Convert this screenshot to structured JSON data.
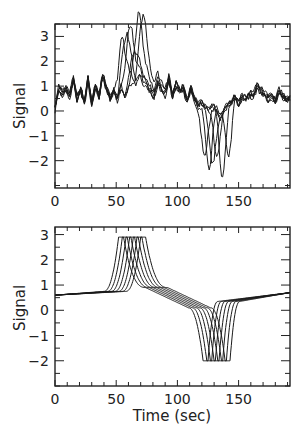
{
  "chart_data": [
    {
      "type": "line",
      "panel": "top",
      "title": "",
      "xlabel": "",
      "ylabel": "Signal",
      "xlim": [
        0,
        192
      ],
      "ylim": [
        -3.1,
        3.5
      ],
      "xticks": [
        0,
        50,
        100,
        150
      ],
      "yticks": [
        -2,
        -1,
        0,
        1,
        2,
        3
      ],
      "xminor_step": 10,
      "yminor_step": 0.5,
      "grid": false,
      "legend": null,
      "description": "Noisy measured signals, ~6 overlapping traces; positive peaks near t=55-72 s (max ~3.3), negative dips near t=122-142 s (min ~-2.7)",
      "baseline_noise": {
        "x": [
          0,
          3,
          6,
          9,
          12,
          15,
          18,
          21,
          24,
          27,
          30,
          33,
          36,
          39,
          42,
          45,
          48,
          51,
          54,
          57,
          60,
          63,
          66,
          69,
          72,
          75,
          78,
          81,
          84,
          87,
          90,
          93,
          96,
          99,
          102,
          105,
          108,
          111,
          114,
          117,
          120,
          123,
          126,
          129,
          132,
          135,
          138,
          141,
          144,
          147,
          150,
          153,
          156,
          159,
          162,
          165,
          168,
          171,
          174,
          177,
          180,
          183,
          186,
          189,
          192
        ],
        "y": [
          0.1,
          0.9,
          0.7,
          0.9,
          0.6,
          1.3,
          0.5,
          0.9,
          0.3,
          1.3,
          0.3,
          1.0,
          0.6,
          1.4,
          0.9,
          0.5,
          0.8,
          0.4,
          0.9,
          0.5,
          0.8,
          1.0,
          0.8,
          1.3,
          1.1,
          1.0,
          0.8,
          0.6,
          1.2,
          0.9,
          0.7,
          1.3,
          0.6,
          1.1,
          0.8,
          0.9,
          0.4,
          0.9,
          0.5,
          0.2,
          0.3,
          0.1,
          0.0,
          0.2,
          0.1,
          -0.2,
          0.1,
          0.3,
          0.4,
          0.6,
          0.3,
          0.6,
          0.5,
          0.7,
          0.6,
          1.0,
          0.8,
          0.7,
          0.5,
          0.6,
          0.4,
          0.8,
          0.6,
          0.5,
          0.5
        ]
      },
      "series": [
        {
          "name": "trace-1",
          "peak_t": 55,
          "peak_y": 2.9,
          "dip_t": 122,
          "dip_y": -1.8
        },
        {
          "name": "trace-2",
          "peak_t": 58,
          "peak_y": 3.1,
          "dip_t": 126,
          "dip_y": -2.2
        },
        {
          "name": "trace-3",
          "peak_t": 61,
          "peak_y": 3.2,
          "dip_t": 129,
          "dip_y": -2.2
        },
        {
          "name": "trace-4",
          "peak_t": 65,
          "peak_y": 2.2,
          "dip_t": 132,
          "dip_y": -1.8
        },
        {
          "name": "trace-5",
          "peak_t": 68,
          "peak_y": 3.3,
          "dip_t": 137,
          "dip_y": -2.7
        },
        {
          "name": "trace-6",
          "peak_t": 72,
          "peak_y": 3.2,
          "dip_t": 142,
          "dip_y": -2.1
        }
      ]
    },
    {
      "type": "line",
      "panel": "bottom",
      "title": "",
      "xlabel": "Time (sec)",
      "ylabel": "Signal",
      "xlim": [
        0,
        192
      ],
      "ylim": [
        -3.0,
        3.3
      ],
      "xticks": [
        0,
        50,
        100,
        150
      ],
      "yticks": [
        -2,
        -1,
        0,
        1,
        2,
        3
      ],
      "xminor_step": 10,
      "yminor_step": 0.5,
      "grid": false,
      "legend": null,
      "description": "Smooth model signals, 7 time-shifted traces; flat-topped peaks at ~2.9 between t≈53-73 s, flat-bottom dips at ~-2.0 between t≈122-142 s; baseline rises from ~0.6 at t=0 to ~0.7 at t=192",
      "baseline": {
        "start": [
          0,
          0.6
        ],
        "pre_peak": [
          45,
          0.75
        ],
        "post_peak_mid": [
          100,
          0.4
        ],
        "pre_dip": [
          118,
          0.1
        ],
        "post_dip": [
          150,
          0.35
        ],
        "end": [
          192,
          0.7
        ]
      },
      "series": [
        {
          "name": "model-1",
          "peak_t": 54,
          "peak_y": 2.9,
          "dip_t": 123,
          "dip_y": -2.0
        },
        {
          "name": "model-2",
          "peak_t": 57,
          "peak_y": 2.9,
          "dip_t": 126,
          "dip_y": -2.0
        },
        {
          "name": "model-3",
          "peak_t": 60,
          "peak_y": 2.9,
          "dip_t": 129,
          "dip_y": -2.0
        },
        {
          "name": "model-4",
          "peak_t": 63,
          "peak_y": 2.9,
          "dip_t": 132,
          "dip_y": -2.0
        },
        {
          "name": "model-5",
          "peak_t": 66,
          "peak_y": 2.9,
          "dip_t": 135,
          "dip_y": -2.0
        },
        {
          "name": "model-6",
          "peak_t": 69,
          "peak_y": 2.9,
          "dip_t": 138,
          "dip_y": -2.0
        },
        {
          "name": "model-7",
          "peak_t": 72,
          "peak_y": 2.9,
          "dip_t": 141,
          "dip_y": -2.0
        }
      ]
    }
  ],
  "panels": {
    "top": {
      "ylabel": "Signal",
      "xtick_labels": [
        "0",
        "50",
        "100",
        "150"
      ],
      "ytick_labels": [
        "3",
        "2",
        "1",
        "0",
        "-1",
        "-2"
      ]
    },
    "bottom": {
      "ylabel": "Signal",
      "xlabel": "Time (sec)",
      "xtick_labels": [
        "0",
        "50",
        "100",
        "150"
      ],
      "ytick_labels": [
        "3",
        "2",
        "1",
        "0",
        "-1",
        "-2"
      ]
    }
  }
}
